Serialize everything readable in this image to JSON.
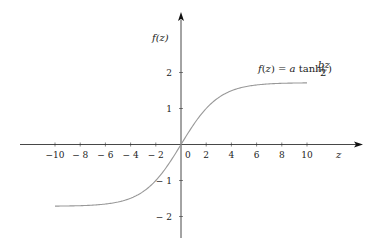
{
  "chart_data": {
    "type": "line",
    "title": "",
    "xlabel": "z",
    "ylabel": "f(z)",
    "annotation": "f(z) = a tanh(bz/2)",
    "xlim": [
      -10,
      10
    ],
    "ylim": [
      -2.5,
      3
    ],
    "x_ticks": [
      -10,
      -8,
      -6,
      -4,
      -2,
      0,
      2,
      4,
      6,
      8,
      10
    ],
    "x_tick_labels": [
      "−10",
      "− 8",
      "− 6",
      "− 4",
      "− 2",
      "0",
      "2",
      "4",
      "6",
      "8",
      "10"
    ],
    "y_ticks": [
      2,
      1,
      -1,
      -2
    ],
    "y_tick_labels": [
      "2",
      "1",
      "− 1",
      "− 2"
    ],
    "grid": false,
    "legend": null,
    "params": {
      "a": 1.7159,
      "b": 0.6667
    },
    "series": [
      {
        "name": "f(z) = a tanh(bz/2)",
        "x": [
          -10,
          -8,
          -6,
          -4,
          -2,
          -1,
          0,
          1,
          2,
          4,
          6,
          8,
          10
        ],
        "y": [
          -1.71,
          -1.7,
          -1.65,
          -1.5,
          -0.96,
          -0.55,
          0,
          0.55,
          0.96,
          1.5,
          1.65,
          1.7,
          1.71
        ]
      }
    ]
  },
  "labels": {
    "x_axis": "z",
    "y_axis": "f(z)",
    "equation": "f(z) = a tanh(",
    "frac_num": "bz",
    "frac_den": "2",
    "equation_end": ")"
  },
  "colors": {
    "axis": "#333333",
    "curve": "#999999",
    "text": "#222222"
  }
}
